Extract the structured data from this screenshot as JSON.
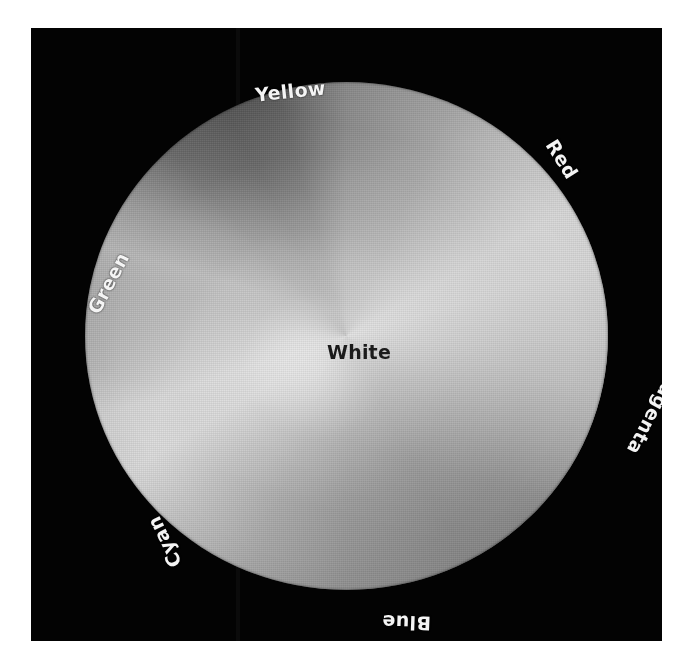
{
  "figure": {
    "kind": "color-wheel",
    "center_label": "White",
    "panel_color": "#030303",
    "background_color": "#ffffff"
  },
  "chart_data": {
    "type": "pie",
    "title": "",
    "subtitle": "",
    "xlabel": "",
    "ylabel": "",
    "grid": false,
    "legend_position": "around-perimeter",
    "center_label": "White",
    "categories": [
      "Red",
      "Yellow",
      "Green",
      "Cyan",
      "Blue",
      "Magenta"
    ],
    "values": [
      60,
      60,
      60,
      60,
      60,
      60
    ],
    "annotations": [
      "White"
    ],
    "series": [
      {
        "name": "hue angle (degrees)",
        "values": [
          0,
          60,
          120,
          180,
          240,
          300
        ]
      },
      {
        "name": "grayscale luminance (0-255)",
        "values": [
          139,
          234,
          174,
          216,
          92,
          79
        ]
      }
    ],
    "sectors": [
      {
        "label": "Yellow",
        "angle_deg": 90,
        "screen_position": "top",
        "label_rotation_deg": -6,
        "gray_hex": "#eaeaea"
      },
      {
        "label": "Red",
        "angle_deg": 30,
        "screen_position": "upper-right",
        "label_rotation_deg": 58,
        "gray_hex": "#8b8b8b"
      },
      {
        "label": "Magenta",
        "angle_deg": 330,
        "screen_position": "lower-right",
        "label_rotation_deg": 118,
        "gray_hex": "#4f4f4f"
      },
      {
        "label": "Blue",
        "angle_deg": 270,
        "screen_position": "bottom",
        "label_rotation_deg": 182,
        "gray_hex": "#5c5c5c"
      },
      {
        "label": "Cyan",
        "angle_deg": 210,
        "screen_position": "lower-left",
        "label_rotation_deg": 244,
        "gray_hex": "#dadada"
      },
      {
        "label": "Green",
        "angle_deg": 150,
        "screen_position": "left",
        "label_rotation_deg": -62,
        "gray_hex": "#aeaeae"
      }
    ],
    "axis_ranges": {
      "hue_deg": [
        0,
        360
      ]
    },
    "colors": {
      "label_text": "#f4f4f4",
      "center_text": "#1b1b1b",
      "field": "#030303"
    }
  },
  "labels": {
    "yellow": "Yellow",
    "red": "Red",
    "magenta": "Magenta",
    "blue": "Blue",
    "cyan": "Cyan",
    "green": "Green",
    "white": "White"
  }
}
